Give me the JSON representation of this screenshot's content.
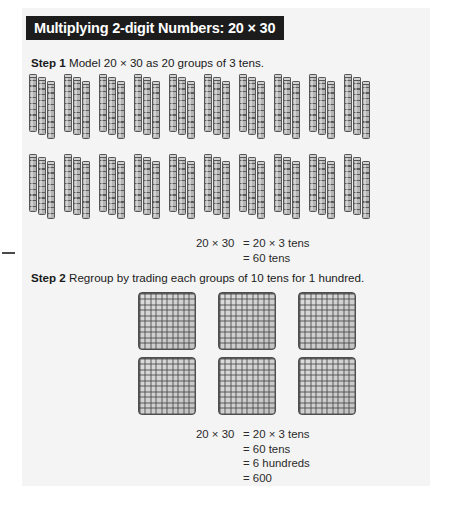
{
  "page": {
    "background_color": "#ffffff",
    "panel_color": "#f4f4f4"
  },
  "header": {
    "title": "Multiplying 2-digit Numbers: 20 × 30",
    "bar_color": "#1c1c1c",
    "text_color": "#ffffff"
  },
  "steps": [
    {
      "label": "Step 1",
      "text": " Model 20 × 30 as 20 groups of 3 tens."
    },
    {
      "label": "Step 2",
      "text": " Regroup by trading each groups of 10 tens for 1 hundred."
    }
  ],
  "step1_model": {
    "manipulative": "base-ten-rod",
    "groups_total": 20,
    "rods_per_group": 3,
    "units_per_rod": 10,
    "rows": [
      {
        "groups": 10
      },
      {
        "groups": 10
      }
    ],
    "rod_fill_color": "#b4b4b4",
    "rod_line_color": "#555555"
  },
  "step2_model": {
    "manipulative": "base-ten-flat",
    "flats_total": 6,
    "units_per_flat": 100,
    "rows": [
      {
        "flats": 3
      },
      {
        "flats": 3
      }
    ],
    "flat_fill_color": "#c2c2c2",
    "flat_line_color": "#4e4e4e"
  },
  "equation_1": {
    "lines": [
      {
        "lhs": "20 × 30",
        "rhs": "= 20 × 3 tens"
      },
      {
        "lhs": "",
        "rhs": "= 60 tens"
      }
    ]
  },
  "equation_2": {
    "lines": [
      {
        "lhs": "20 × 30",
        "rhs": "= 20 × 3 tens"
      },
      {
        "lhs": "",
        "rhs": "= 60 tens"
      },
      {
        "lhs": "",
        "rhs": "= 6 hundreds"
      },
      {
        "lhs": "",
        "rhs": "= 600"
      }
    ]
  }
}
